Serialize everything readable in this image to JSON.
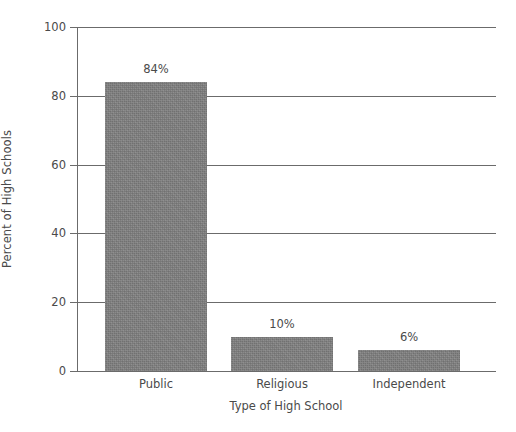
{
  "chart_data": {
    "type": "bar",
    "title": "",
    "subtitle": "",
    "categories": [
      "Public",
      "Religious",
      "Independent"
    ],
    "values": [
      84,
      10,
      6
    ],
    "value_labels": [
      "84%",
      "10%",
      "6%"
    ],
    "series": [
      {
        "name": "Percent of High Schools",
        "values": [
          84,
          10,
          6
        ]
      }
    ],
    "xlabel": "Type of High School",
    "ylabel": "Percent of High Schools",
    "ylim": [
      0,
      100
    ],
    "y_ticks": [
      0,
      20,
      40,
      60,
      80,
      100
    ],
    "y_tick_labels": [
      "0",
      "20",
      "40",
      "60",
      "80",
      "100"
    ],
    "grid": true,
    "grid_axis": "y",
    "legend": false,
    "legend_position": "none",
    "orientation": "vertical",
    "bar_color": "#808080",
    "axis_color": "#6b6b6b",
    "text_color": "#4a4a4a",
    "background_color": "#ffffff"
  }
}
